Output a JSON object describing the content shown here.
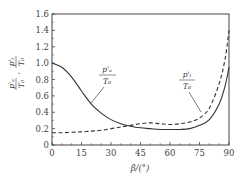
{
  "chart_data": {
    "type": "line",
    "title": "",
    "xlabel": "β/(°)",
    "ylabel": "p'a/T0 , p't/T0",
    "xlim": [
      0,
      90
    ],
    "ylim": [
      0,
      1.6
    ],
    "grid": false,
    "legend_position": "inline annotations",
    "x_ticks": [
      0,
      15,
      30,
      45,
      60,
      75,
      90
    ],
    "y_ticks": [
      0,
      0.2,
      0.4,
      0.6,
      0.8,
      1.0,
      1.2,
      1.4,
      1.6
    ],
    "x_tick_labels": [
      "0",
      "15",
      "30",
      "45",
      "60",
      "75",
      "90"
    ],
    "y_tick_labels": [
      "0",
      "0.2",
      "0.4",
      "0.6",
      "0.8",
      "1.0",
      "1.2",
      "1.4",
      "1.6"
    ],
    "x": [
      0,
      5,
      10,
      15,
      20,
      25,
      30,
      35,
      40,
      45,
      50,
      55,
      60,
      65,
      70,
      75,
      80,
      85,
      88,
      90
    ],
    "series": [
      {
        "name": "p'a/T0",
        "style": "solid",
        "values": [
          1.0,
          0.95,
          0.83,
          0.66,
          0.5,
          0.39,
          0.31,
          0.26,
          0.23,
          0.21,
          0.2,
          0.19,
          0.19,
          0.19,
          0.2,
          0.24,
          0.31,
          0.5,
          0.72,
          0.95
        ]
      },
      {
        "name": "p't/T0",
        "style": "dashed",
        "values": [
          0.15,
          0.15,
          0.155,
          0.16,
          0.17,
          0.18,
          0.2,
          0.22,
          0.24,
          0.26,
          0.27,
          0.26,
          0.25,
          0.26,
          0.28,
          0.33,
          0.45,
          0.75,
          1.05,
          1.4
        ]
      }
    ],
    "annotations": [
      {
        "label_num": "p'a",
        "label_den": "T0",
        "points_to": "p'a/T0",
        "text_x": 27,
        "text_y": 0.83
      },
      {
        "label_num": "p't",
        "label_den": "T0",
        "points_to": "p't/T0",
        "text_x": 67,
        "text_y": 0.8
      }
    ]
  },
  "labels": {
    "xlabel": "β/(°)",
    "ylabel_top_num": "p'ₐ",
    "ylabel_top_den": "T₀",
    "ylabel_bottom_num": "p'ₜ",
    "ylabel_bottom_den": "T₀",
    "annot1_num": "p'ₐ",
    "annot1_den": "T₀",
    "annot2_num": "p'ₜ",
    "annot2_den": "T₀"
  },
  "colors": {
    "axis": "#444444",
    "line": "#333333",
    "text": "#444444",
    "background": "#ffffff"
  }
}
